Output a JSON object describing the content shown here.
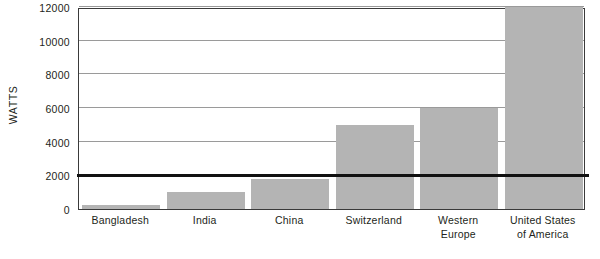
{
  "chart_data": {
    "type": "bar",
    "title": "",
    "xlabel": "",
    "ylabel": "WATTS",
    "categories": [
      "Bangladesh",
      "India",
      "China",
      "Switzerland",
      "Western Europe",
      "United States of America"
    ],
    "category_lines": [
      [
        "Bangladesh"
      ],
      [
        "India"
      ],
      [
        "China"
      ],
      [
        "Switzerland"
      ],
      [
        "Western",
        "Europe"
      ],
      [
        "United States",
        "of America"
      ]
    ],
    "values": [
      250,
      1000,
      1800,
      5000,
      6000,
      12000
    ],
    "ylim": [
      0,
      12000
    ],
    "yticks": [
      0,
      2000,
      4000,
      6000,
      8000,
      10000,
      12000
    ],
    "ytick_labels": [
      "0",
      "2000",
      "4000",
      "6000",
      "8000",
      "10000",
      "12000"
    ],
    "grid": true,
    "legend": false,
    "annotations": [
      {
        "name": "reference-line",
        "value": 2000,
        "style": "thick-black-horizontal-rule"
      }
    ],
    "colors": {
      "bar_fill": "#b4b4b4",
      "gridline": "#9a9a9a",
      "frame": "#3a3a3a",
      "reference_line": "#111111",
      "text": "#231f20",
      "background": "#ffffff"
    }
  }
}
